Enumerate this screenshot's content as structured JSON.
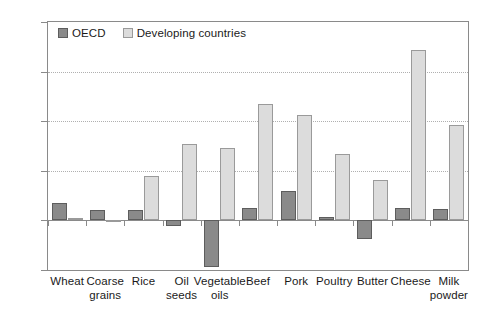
{
  "chart_data": {
    "type": "bar",
    "title": "",
    "subtitle": "",
    "xlabel": "",
    "ylabel": "",
    "ylim": [
      -50,
      200
    ],
    "yticks": [
      200,
      150,
      100,
      50,
      0,
      -50
    ],
    "ytick_labels": [
      "200",
      "150",
      "100",
      "50",
      "0",
      "-50"
    ],
    "grid": true,
    "grid_style": "dotted-horizontal",
    "legend_position": "top-left-inside",
    "categories": [
      "Wheat",
      "Coarse grains",
      "Rice",
      "Oil seeds",
      "Vegetable oils",
      "Beef",
      "Pork",
      "Poultry",
      "Butter",
      "Cheese",
      "Milk powder"
    ],
    "category_lines": [
      [
        "Wheat"
      ],
      [
        "Coarse",
        "grains"
      ],
      [
        "Rice"
      ],
      [
        "Oil",
        "seeds"
      ],
      [
        "Vegetable",
        "oils"
      ],
      [
        "Beef"
      ],
      [
        "Pork"
      ],
      [
        "Poultry"
      ],
      [
        "Butter"
      ],
      [
        "Cheese"
      ],
      [
        "Milk",
        "powder"
      ]
    ],
    "series": [
      {
        "name": "OECD",
        "color": "#8a8a8a",
        "values": [
          18,
          10,
          10,
          -6,
          -47,
          12,
          30,
          3,
          -19,
          12,
          11
        ]
      },
      {
        "name": "Developing countries",
        "color": "#dcdcdc",
        "values": [
          2,
          -2,
          45,
          77,
          73,
          117,
          106,
          67,
          41,
          172,
          96
        ]
      }
    ]
  },
  "legend": {
    "items": [
      {
        "label": "OECD",
        "swatch": "oecd"
      },
      {
        "label": "Developing countries",
        "swatch": "dev"
      }
    ]
  },
  "colors": {
    "oecd": "#8a8a8a",
    "developing": "#dcdcdc",
    "axis": "#8a8a8a",
    "grid": "#b0b0b0",
    "text": "#1a1a1a",
    "background": "#ffffff"
  }
}
